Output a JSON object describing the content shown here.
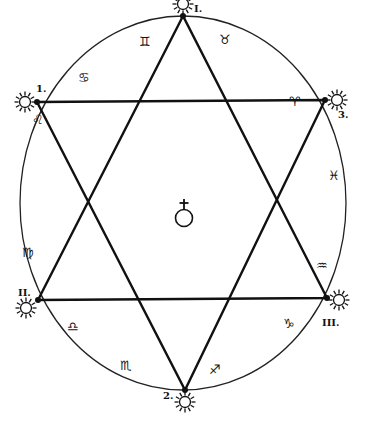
{
  "diagram": {
    "type": "hexagram-in-circle",
    "center_symbol": {
      "name": "earth-cross-symbol",
      "glyph": "♁"
    },
    "vertices": [
      {
        "id": "I",
        "label": "I.",
        "x": 183,
        "y": 16,
        "label_x": 194,
        "label_y": 4
      },
      {
        "id": "1",
        "label": "1.",
        "x": 37,
        "y": 102,
        "label_x": 36,
        "label_y": 84
      },
      {
        "id": "3",
        "label": "3.",
        "x": 325,
        "y": 100,
        "label_x": 338,
        "label_y": 110
      },
      {
        "id": "II",
        "label": "II.",
        "x": 38,
        "y": 300,
        "label_x": 18,
        "label_y": 288
      },
      {
        "id": "III",
        "label": "III.",
        "x": 327,
        "y": 298,
        "label_x": 322,
        "label_y": 318
      },
      {
        "id": "2",
        "label": "2.",
        "x": 185,
        "y": 390,
        "label_x": 163,
        "label_y": 391
      }
    ],
    "triangles": [
      {
        "name": "upward-triangle",
        "points": [
          "I",
          "II",
          "III"
        ]
      },
      {
        "name": "downward-triangle",
        "points": [
          "1",
          "3",
          "2"
        ]
      }
    ],
    "zodiac": [
      {
        "name": "gemini",
        "glyph": "♊",
        "x": 145,
        "y": 42
      },
      {
        "name": "taurus",
        "glyph": "♉",
        "x": 225,
        "y": 40
      },
      {
        "name": "cancer",
        "glyph": "♋",
        "x": 84,
        "y": 78
      },
      {
        "name": "aries",
        "glyph": "♈",
        "x": 295,
        "y": 102
      },
      {
        "name": "leo",
        "glyph": "♌",
        "x": 38,
        "y": 120
      },
      {
        "name": "pisces",
        "glyph": "♓",
        "x": 334,
        "y": 176
      },
      {
        "name": "virgo",
        "glyph": "♍",
        "x": 28,
        "y": 253
      },
      {
        "name": "aquarius",
        "glyph": "♒",
        "x": 322,
        "y": 266
      },
      {
        "name": "libra",
        "glyph": "♎",
        "x": 73,
        "y": 327
      },
      {
        "name": "capricorn",
        "glyph": "♑",
        "x": 289,
        "y": 324
      },
      {
        "name": "scorpio",
        "glyph": "♏",
        "x": 126,
        "y": 366
      },
      {
        "name": "sagittarius",
        "glyph": "♐",
        "x": 215,
        "y": 370
      }
    ]
  }
}
